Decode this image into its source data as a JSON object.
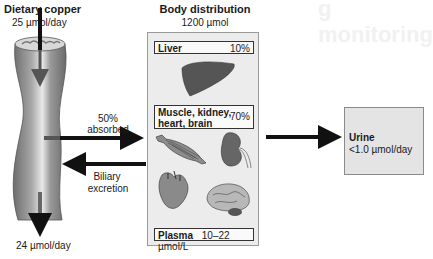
{
  "background_watermark": "g monitoring",
  "intake": {
    "title": "Dietary copper",
    "amount": "25 µmol/day"
  },
  "gut": {
    "absorbed_pct": "50%",
    "absorbed_label": "absorbed",
    "biliary_label_1": "Biliary",
    "biliary_label_2": "excretion",
    "fecal_output": "24 µmol/day"
  },
  "body_distribution": {
    "title": "Body distribution",
    "total": "1200 µmol",
    "compartments": [
      {
        "label": "Liver",
        "value": "10%",
        "icon": "liver-icon"
      },
      {
        "label": "Muscle, kidney, heart, brain",
        "label_line1": "Muscle, kidney,",
        "label_line2": "heart, brain",
        "value": "70%",
        "icons": [
          "muscle-icon",
          "kidney-icon",
          "heart-icon",
          "brain-icon"
        ]
      },
      {
        "label": "Plasma",
        "value": "10–22 µmol/L"
      }
    ]
  },
  "urine": {
    "title": "Urine",
    "amount": "<1.0 µmol/day"
  },
  "colors": {
    "arrow": "#111111",
    "box_fill": "#ececec",
    "urine_fill": "#e4e4e4",
    "organ_dark": "#555555",
    "tube": "#8a8a8a"
  }
}
